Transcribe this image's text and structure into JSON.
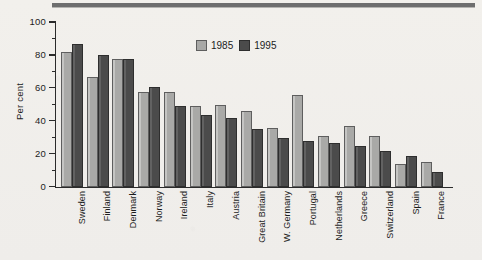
{
  "page": {
    "background_color": "#f2f0ec",
    "rule_color": "#6e6e6e"
  },
  "legend": {
    "position": "top-center",
    "items": [
      {
        "label": "1985",
        "color": "#a9a9a7",
        "swatch": "legend-swatch-1985"
      },
      {
        "label": "1995",
        "color": "#4b4b4b",
        "swatch": "legend-swatch-1995"
      }
    ]
  },
  "chart_data": {
    "type": "bar",
    "title": "",
    "xlabel": "",
    "ylabel": "Per cent",
    "ylim": [
      0,
      100
    ],
    "yticks": [
      0,
      20,
      40,
      60,
      80,
      100
    ],
    "ytick_labels": [
      "0",
      "20",
      "40",
      "60",
      "80",
      "100"
    ],
    "minor_yticks": [
      10,
      30,
      50,
      70,
      90
    ],
    "grid": false,
    "legend_position": "top-center",
    "categories": [
      "Sweden",
      "Finland",
      "Denmark",
      "Norway",
      "Ireland",
      "Italy",
      "Austria",
      "Great Britain",
      "W. Germany",
      "Portugal",
      "Netherlands",
      "Greece",
      "Switzerland",
      "Spain",
      "France"
    ],
    "series": [
      {
        "name": "1985",
        "color": "#a9a9a7",
        "values": [
          82,
          67,
          78,
          58,
          58,
          49,
          50,
          46,
          36,
          56,
          31,
          37,
          31,
          14,
          15
        ]
      },
      {
        "name": "1995",
        "color": "#4b4b4b",
        "values": [
          87,
          80,
          78,
          61,
          49,
          44,
          42,
          35,
          30,
          28,
          27,
          25,
          22,
          19,
          9
        ]
      }
    ]
  }
}
